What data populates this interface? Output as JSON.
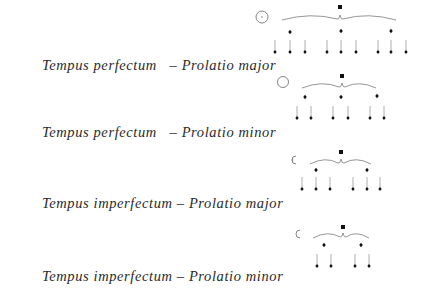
{
  "rows": [
    {
      "tempus": "Tempus perfectum",
      "separator": "   – ",
      "prolatio": "Prolatio major",
      "sign": "circle-with-dot",
      "brevis": [
        340,
        7
      ],
      "brace": [
        282,
        396,
        18
      ],
      "semibreves": [
        [
          290,
          32
        ],
        [
          341,
          31
        ],
        [
          391,
          31
        ]
      ],
      "minims": [
        275,
        290,
        305,
        327,
        341,
        356,
        378,
        391,
        406
      ],
      "minim_y": 52,
      "sign_pos": [
        262,
        17,
        6
      ]
    },
    {
      "tempus": "Tempus perfectum",
      "separator": "   – ",
      "prolatio": "Prolatio minor",
      "sign": "circle",
      "brevis": [
        342,
        76
      ],
      "brace": [
        302,
        376,
        86
      ],
      "semibreves": [
        [
          305,
          97
        ],
        [
          341,
          97
        ],
        [
          377,
          96
        ]
      ],
      "minims": [
        297,
        311,
        333,
        348,
        370,
        384
      ],
      "minim_y": 118,
      "sign_pos": [
        283,
        82,
        5.5
      ]
    },
    {
      "tempus": "Tempus imperfectum",
      "separator": " – ",
      "prolatio": "Prolatio major",
      "sign": "half-circle-with-dot",
      "brevis": [
        341,
        152
      ],
      "brace": [
        310,
        371,
        162
      ],
      "semibreves": [
        [
          316,
          170
        ],
        [
          367,
          170
        ]
      ],
      "minims": [
        302,
        316,
        330,
        353,
        367,
        380
      ],
      "minim_y": 189,
      "sign_pos": [
        292,
        160,
        4
      ]
    },
    {
      "tempus": "Tempus imperfectum",
      "separator": " – ",
      "prolatio": "Prolatio minor",
      "sign": "half-circle",
      "brevis": [
        343,
        227
      ],
      "brace": [
        313,
        369,
        236
      ],
      "semibreves": [
        [
          324,
          245
        ],
        [
          361,
          245
        ]
      ],
      "minims": [
        317,
        331,
        355,
        369
      ],
      "minim_y": 266,
      "sign_pos": [
        296,
        234,
        4
      ]
    }
  ],
  "label_baselines": [
    55,
    122,
    193,
    266
  ],
  "colors": {
    "text": "#2a2a2a",
    "note": "#111111",
    "stem": "#9a9a9a",
    "brace": "#8a8a8a",
    "sign": "#777777"
  }
}
